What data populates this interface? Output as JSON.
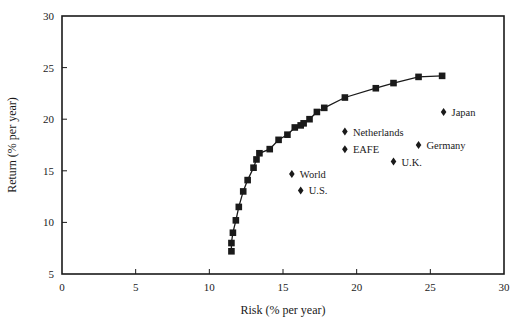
{
  "chart_data": {
    "type": "scatter",
    "title": "",
    "xlabel": "Risk (% per year)",
    "ylabel": "Return (% per year)",
    "xlim": [
      0,
      30
    ],
    "ylim": [
      5,
      30
    ],
    "xticks": [
      0,
      5,
      10,
      15,
      20,
      25,
      30
    ],
    "yticks": [
      5,
      10,
      15,
      20,
      25,
      30
    ],
    "grid": false,
    "legend": "none",
    "series": [
      {
        "name": "Efficient frontier",
        "kind": "line-with-square-markers",
        "x": [
          11.5,
          11.5,
          11.6,
          11.8,
          12.0,
          12.3,
          12.6,
          13.0,
          13.2,
          13.4,
          14.1,
          14.7,
          15.3,
          15.8,
          16.2,
          16.4,
          16.8,
          17.3,
          17.8,
          19.2,
          21.3,
          22.5,
          24.2,
          25.8
        ],
        "y": [
          7.2,
          8.0,
          9.0,
          10.2,
          11.5,
          13.0,
          14.1,
          15.3,
          16.1,
          16.7,
          17.1,
          18.0,
          18.5,
          19.2,
          19.4,
          19.6,
          20.0,
          20.7,
          21.1,
          22.1,
          23.0,
          23.5,
          24.1,
          24.2
        ]
      },
      {
        "name": "Markets",
        "kind": "diamond-markers",
        "points": [
          {
            "label": "Japan",
            "x": 25.9,
            "y": 20.7
          },
          {
            "label": "Netherlands",
            "x": 19.2,
            "y": 18.8
          },
          {
            "label": "Germany",
            "x": 24.2,
            "y": 17.5
          },
          {
            "label": "EAFE",
            "x": 19.2,
            "y": 17.1
          },
          {
            "label": "U.K.",
            "x": 22.5,
            "y": 15.9
          },
          {
            "label": "World",
            "x": 15.6,
            "y": 14.7
          },
          {
            "label": "U.S.",
            "x": 16.2,
            "y": 13.1
          }
        ]
      }
    ]
  },
  "colors": {
    "ink": "#1a1a1a",
    "background": "#ffffff"
  }
}
